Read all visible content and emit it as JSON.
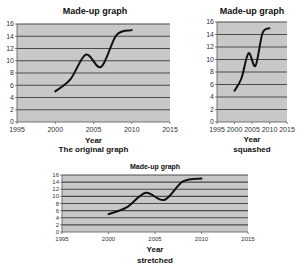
{
  "chart_data": [
    {
      "type": "line",
      "title": "Made-up graph",
      "caption": "The original graph",
      "xlabel": "Year",
      "ylabel": "",
      "x": [
        2000,
        2002,
        2004,
        2006,
        2008,
        2010
      ],
      "values": [
        5,
        7,
        11,
        9,
        14.2,
        15
      ],
      "xlim": [
        1995,
        2015
      ],
      "ylim": [
        0,
        16
      ],
      "xticks": [
        1995,
        2000,
        2005,
        2010,
        2015
      ],
      "yticks": [
        0,
        2,
        4,
        6,
        8,
        10,
        12,
        14,
        16
      ],
      "grid": true,
      "smooth": true,
      "plot_bg": "#c8c8c8",
      "grid_color": "#4a4a4a",
      "line_color": "#111111"
    },
    {
      "type": "line",
      "title": "Made-up graph",
      "caption": "squashed",
      "xlabel": "Year",
      "ylabel": "",
      "x": [
        2000,
        2002,
        2004,
        2006,
        2008,
        2010
      ],
      "values": [
        5,
        7,
        11,
        9,
        14.2,
        15
      ],
      "xlim": [
        1995,
        2015
      ],
      "ylim": [
        0,
        16
      ],
      "xticks": [
        1995,
        2000,
        2005,
        2010,
        2015
      ],
      "yticks": [
        0,
        2,
        4,
        6,
        8,
        10,
        12,
        14,
        16
      ],
      "grid": true,
      "smooth": true,
      "plot_bg": "#c8c8c8",
      "grid_color": "#4a4a4a",
      "line_color": "#111111"
    },
    {
      "type": "line",
      "title": "Made-up graph",
      "caption": "stretched",
      "xlabel": "Year",
      "ylabel": "",
      "x": [
        2000,
        2002,
        2004,
        2006,
        2008,
        2010
      ],
      "values": [
        5,
        7,
        11,
        9,
        14.2,
        15
      ],
      "xlim": [
        1995,
        2015
      ],
      "ylim": [
        0,
        16
      ],
      "xticks": [
        1995,
        2000,
        2005,
        2010,
        2015
      ],
      "yticks": [
        0,
        2,
        4,
        6,
        8,
        10,
        12,
        14,
        16
      ],
      "grid": true,
      "smooth": true,
      "plot_bg": "#c8c8c8",
      "grid_color": "#4a4a4a",
      "line_color": "#111111"
    }
  ],
  "layout": [
    {
      "name": "original",
      "plot": {
        "x": 17,
        "y": 24,
        "w": 153,
        "h": 98
      },
      "title": {
        "x": 95,
        "y": 6,
        "size": 9
      },
      "xlabel_y": 136,
      "caption_y": 145,
      "tick_font": 7
    },
    {
      "name": "squashed",
      "plot": {
        "x": 217,
        "y": 22,
        "w": 70,
        "h": 100
      },
      "title": {
        "x": 252,
        "y": 6,
        "size": 9
      },
      "xlabel_y": 135,
      "caption_y": 145,
      "tick_font": 7
    },
    {
      "name": "stretched",
      "plot": {
        "x": 62,
        "y": 175,
        "w": 186,
        "h": 57
      },
      "title": {
        "x": 155,
        "y": 163,
        "size": 7
      },
      "xlabel_y": 245,
      "caption_y": 256,
      "tick_font": 6
    }
  ]
}
